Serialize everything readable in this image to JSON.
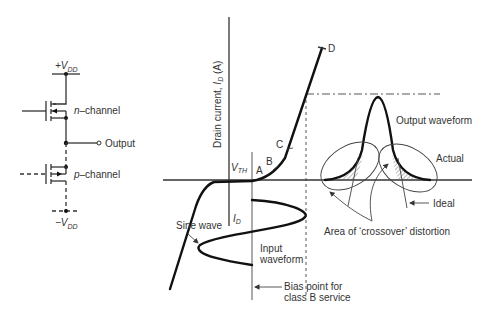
{
  "circuit": {
    "supply_positive": {
      "prefix": "+V",
      "sub": "DD"
    },
    "supply_negative": {
      "prefix": "−V",
      "sub": "DD"
    },
    "n_channel": {
      "italic": "n",
      "rest": "–channel"
    },
    "p_channel": {
      "italic": "p",
      "rest": "–channel"
    },
    "output_label": "Output"
  },
  "graph": {
    "y_axis_label": {
      "text": "Drain current, ",
      "symbol": "I",
      "sub": "D",
      "unit": " (A)"
    },
    "threshold_label": {
      "symbol": "V",
      "sub": "TH"
    },
    "id_label": {
      "symbol": "I",
      "sub": "D"
    },
    "points": [
      "A",
      "B",
      "C",
      "D"
    ],
    "sine_wave_label": "Sine wave",
    "input_waveform_label": [
      "Input",
      "waveform"
    ],
    "bias_point_label": [
      "Bias point for",
      "class B service"
    ],
    "output_waveform_label": "Output waveform",
    "actual_label": "Actual",
    "ideal_label": "Ideal",
    "crossover_label": "Area of ‘crossover’ distortion"
  }
}
